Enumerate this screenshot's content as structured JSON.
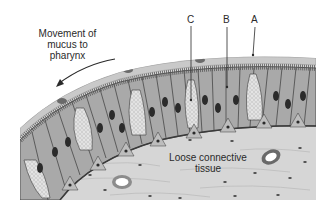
{
  "diagram": {
    "type": "histology-illustration",
    "labels": {
      "movement": [
        "Movement of",
        "mucus to",
        "pharynx"
      ],
      "connective": [
        "Loose connective",
        "tissue"
      ],
      "A": "A",
      "B": "B",
      "C": "C"
    },
    "colors": {
      "mucus_layer": "#c9c9c9",
      "cells": "#a9a9a9",
      "goblet": "#dcdcdc",
      "connective": "#d6d6d6",
      "nucleus": "#2b2b2b",
      "outline": "#3a3a3a",
      "text": "#2a2a2a"
    }
  }
}
